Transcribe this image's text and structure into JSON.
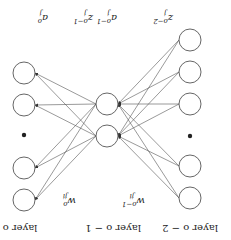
{
  "orientation": "rotated-180",
  "layers": [
    {
      "label": "layer o − 2",
      "node_label": "z",
      "node_sup": "o−2",
      "node_sub": "j"
    },
    {
      "label": "layer o − 1",
      "node_label_z": "z",
      "node_label_a": "a",
      "node_sup": "o−1",
      "node_sub": "j"
    },
    {
      "label": "layer o",
      "node_label": "a",
      "node_sup": "o",
      "node_sub": "j"
    }
  ],
  "weights": [
    {
      "label": "w",
      "sup": "o−1",
      "sub": "ji"
    },
    {
      "label": "w",
      "sup": "o",
      "sub": "ji"
    }
  ],
  "colors": {
    "stroke": "#555555",
    "text": "#222222",
    "background": "#ffffff"
  }
}
